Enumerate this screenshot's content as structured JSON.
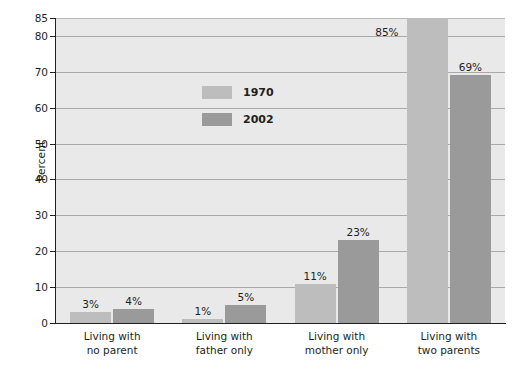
{
  "chart_data": {
    "type": "bar",
    "title": "",
    "xlabel": "",
    "ylabel": "Percent",
    "ylim": [
      0,
      85
    ],
    "yticks": [
      0,
      10,
      20,
      30,
      40,
      50,
      60,
      70,
      80,
      85
    ],
    "ytick_labels": [
      "0",
      "10",
      "20",
      "30",
      "40",
      "50",
      "60",
      "70",
      "80",
      "85"
    ],
    "grid": true,
    "legend_position": "upper-left-inside",
    "categories": [
      "Living with\nno parent",
      "Living with\nfather only",
      "Living with\nmother only",
      "Living with\ntwo parents"
    ],
    "category_lines": [
      [
        "Living with",
        "no parent"
      ],
      [
        "Living with",
        "father only"
      ],
      [
        "Living with",
        "mother only"
      ],
      [
        "Living with",
        "two parents"
      ]
    ],
    "series": [
      {
        "name": "1970",
        "color": "#bdbdbd",
        "values": [
          3,
          1,
          11,
          85
        ],
        "data_labels": [
          "3%",
          "1%",
          "11%",
          "85%"
        ]
      },
      {
        "name": "2002",
        "color": "#9a9a9a",
        "values": [
          4,
          5,
          23,
          69
        ],
        "data_labels": [
          "4%",
          "5%",
          "23%",
          "69%"
        ]
      }
    ],
    "colors": {
      "plot_background": "#e9e9e9",
      "gridline": "#a9a9a9",
      "axis": "#231f20",
      "text": "#231f20",
      "series_1970": "#bdbdbd",
      "series_2002": "#9a9a9a"
    }
  },
  "legend": {
    "items": [
      {
        "label": "1970",
        "color": "#bdbdbd"
      },
      {
        "label": "2002",
        "color": "#9a9a9a"
      }
    ]
  },
  "axes": {
    "y_title": "Percent"
  }
}
